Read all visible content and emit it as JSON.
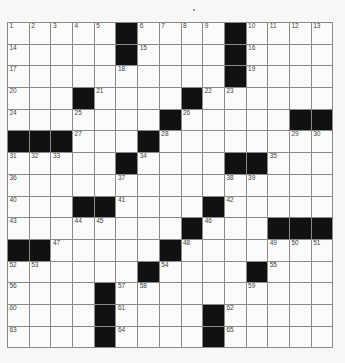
{
  "puzzle": {
    "rows": 15,
    "cols": 15,
    "layout": [
      "1,2,3,4,5,#,6,7,8,9,#,10,11,12,13",
      "14,.,.,.,.,#,15,.,.,.,#,16,.,.,.",
      "17,.,.,.,.,18,.,.,.,.,#,19,.,.,.",
      "20,.,.,#,21,.,.,.,#,22,23,.,.,.,.",
      "24,.,.,25,.,.,.,#,26,.,.,.,.,#,#",
      "#,#,#,27,.,.,#,28,.,.,.,.,.,29,30",
      "31,32,33,.,.,#,34,.,.,.,#,#,35,.,.",
      "36,.,.,.,.,37,.,.,.,.,38,39,.,.,.",
      "40,.,.,#,#,41,.,.,.,#,42,.,.,.,.",
      "43,.,.,44,45,.,.,.,#,46,.,.,#,#,#",
      "#,#,47,.,.,.,.,#,48,.,.,.,49,50,51",
      "52,53,.,.,.,.,#,54,.,.,.,#,55,.,.",
      "56,.,.,.,#,57,58,.,.,.,.,59,.,.,.",
      "60,.,.,.,#,61,.,.,.,#,62,.,.,.,.",
      "63,.,.,.,#,64,.,.,.,#,65,.,.,.,."
    ]
  }
}
